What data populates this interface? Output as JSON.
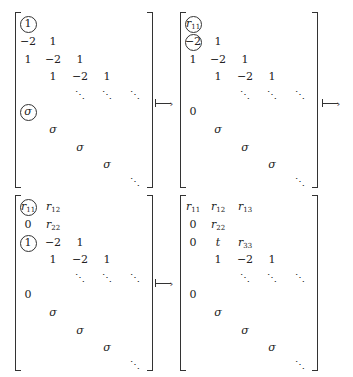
{
  "figure": {
    "arrow_symbol": "mapsto",
    "matrices": [
      {
        "id": "m1",
        "rows": [
          [
            {
              "t": "1",
              "circled": true
            },
            "",
            "",
            "",
            ""
          ],
          [
            "−2",
            "1",
            "",
            "",
            ""
          ],
          [
            "1",
            "−2",
            "1",
            "",
            ""
          ],
          [
            "",
            "1",
            "−2",
            "1",
            ""
          ],
          [
            "",
            "",
            "⋱",
            "⋱",
            "⋱"
          ],
          [
            {
              "t": "σ",
              "circled": true,
              "it": true
            },
            "",
            "",
            "",
            ""
          ],
          [
            "",
            {
              "t": "σ",
              "it": true
            },
            "",
            "",
            ""
          ],
          [
            "",
            "",
            {
              "t": "σ",
              "it": true
            },
            "",
            ""
          ],
          [
            "",
            "",
            "",
            {
              "t": "σ",
              "it": true
            },
            ""
          ],
          [
            "",
            "",
            "",
            "",
            "⋱"
          ]
        ]
      },
      {
        "id": "m2",
        "rows": [
          [
            {
              "t": "r",
              "sub": "11",
              "circled": true,
              "it": true
            },
            "",
            "",
            "",
            ""
          ],
          [
            {
              "t": "−2",
              "circled": true
            },
            "1",
            "",
            "",
            ""
          ],
          [
            "1",
            "−2",
            "1",
            "",
            ""
          ],
          [
            "",
            "1",
            "−2",
            "1",
            ""
          ],
          [
            "",
            "",
            "⋱",
            "⋱",
            "⋱"
          ],
          [
            "0",
            "",
            "",
            "",
            ""
          ],
          [
            "",
            {
              "t": "σ",
              "it": true
            },
            "",
            "",
            ""
          ],
          [
            "",
            "",
            {
              "t": "σ",
              "it": true
            },
            "",
            ""
          ],
          [
            "",
            "",
            "",
            {
              "t": "σ",
              "it": true
            },
            ""
          ],
          [
            "",
            "",
            "",
            "",
            "⋱"
          ]
        ]
      },
      {
        "id": "m3",
        "rows": [
          [
            {
              "t": "r",
              "sub": "11",
              "circled": true,
              "it": true
            },
            {
              "t": "r",
              "sub": "12",
              "it": true
            },
            "",
            "",
            ""
          ],
          [
            "0",
            {
              "t": "r",
              "sub": "22",
              "it": true
            },
            "",
            "",
            ""
          ],
          [
            {
              "t": "1",
              "circled": true
            },
            "−2",
            "1",
            "",
            ""
          ],
          [
            "",
            "1",
            "−2",
            "1",
            ""
          ],
          [
            "",
            "",
            "⋱",
            "⋱",
            "⋱"
          ],
          [
            "0",
            "",
            "",
            "",
            ""
          ],
          [
            "",
            {
              "t": "σ",
              "it": true
            },
            "",
            "",
            ""
          ],
          [
            "",
            "",
            {
              "t": "σ",
              "it": true
            },
            "",
            ""
          ],
          [
            "",
            "",
            "",
            {
              "t": "σ",
              "it": true
            },
            ""
          ],
          [
            "",
            "",
            "",
            "",
            "⋱"
          ]
        ]
      },
      {
        "id": "m4",
        "rows": [
          [
            {
              "t": "r",
              "sub": "11",
              "it": true
            },
            {
              "t": "r",
              "sub": "12",
              "it": true
            },
            {
              "t": "r",
              "sub": "13",
              "it": true
            },
            "",
            ""
          ],
          [
            "0",
            {
              "t": "r",
              "sub": "22",
              "it": true
            },
            "",
            "",
            ""
          ],
          [
            "0",
            {
              "t": "t",
              "it": true
            },
            {
              "t": "r",
              "sub": "33",
              "it": true
            },
            "",
            ""
          ],
          [
            "",
            "1",
            "−2",
            "1",
            ""
          ],
          [
            "",
            "",
            "⋱",
            "⋱",
            "⋱"
          ],
          [
            "0",
            "",
            "",
            "",
            ""
          ],
          [
            "",
            {
              "t": "σ",
              "it": true
            },
            "",
            "",
            ""
          ],
          [
            "",
            "",
            {
              "t": "σ",
              "it": true
            },
            "",
            ""
          ],
          [
            "",
            "",
            "",
            {
              "t": "σ",
              "it": true
            },
            ""
          ],
          [
            "",
            "",
            "",
            "",
            "⋱"
          ]
        ]
      }
    ],
    "arrows": [
      {
        "label": "↦",
        "after": "m1"
      },
      {
        "label": "↦",
        "after": "m2"
      },
      {
        "label": "↦",
        "after": "m3"
      }
    ]
  }
}
